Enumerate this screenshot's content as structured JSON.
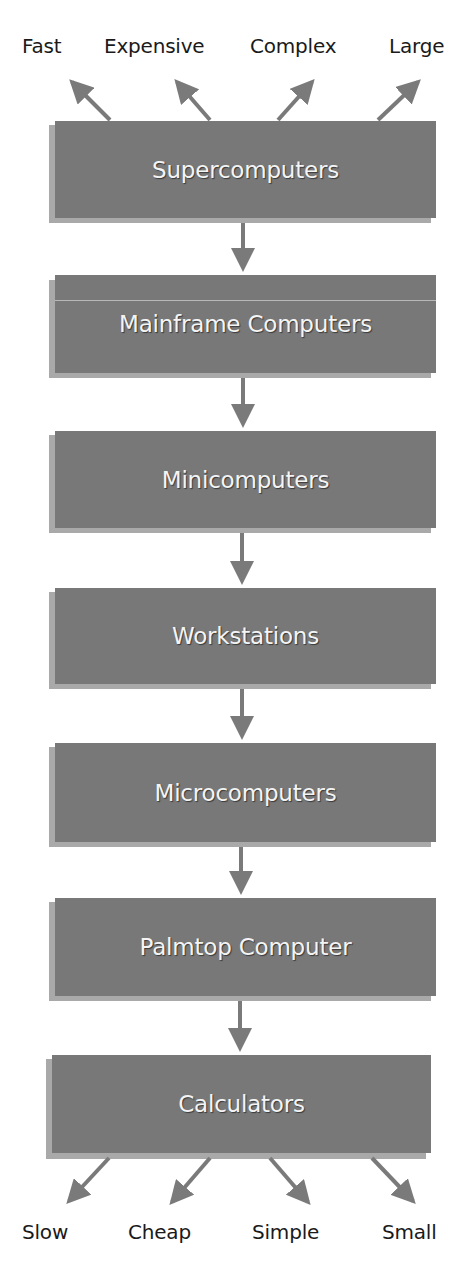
{
  "diagram": {
    "type": "hierarchy",
    "top_attributes": [
      {
        "label": "Fast"
      },
      {
        "label": "Expensive"
      },
      {
        "label": "Complex"
      },
      {
        "label": "Large"
      }
    ],
    "levels": [
      {
        "label": "Supercomputers"
      },
      {
        "label": "Mainframe Computers"
      },
      {
        "label": "Minicomputers"
      },
      {
        "label": "Workstations"
      },
      {
        "label": "Microcomputers"
      },
      {
        "label": "Palmtop Computer"
      },
      {
        "label": "Calculators"
      }
    ],
    "bottom_attributes": [
      {
        "label": "Slow"
      },
      {
        "label": "Cheap"
      },
      {
        "label": "Simple"
      },
      {
        "label": "Small"
      }
    ],
    "colors": {
      "box_fill": "#787878",
      "box_shadow": "#a9a9a9",
      "box_text": "#f4f4f4",
      "arrow": "#7a7a7a",
      "label_text": "#1a1a1a"
    }
  }
}
